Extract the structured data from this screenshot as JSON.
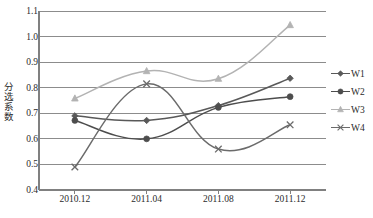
{
  "chart_data": {
    "type": "line",
    "title": "",
    "xlabel": "",
    "ylabel": "分选系数",
    "categories": [
      "2010.12",
      "2011.04",
      "2011.08",
      "2011.12"
    ],
    "ylim": [
      0.4,
      1.1
    ],
    "yticks": [
      "0.4",
      "0.5",
      "0.6",
      "0.7",
      "0.8",
      "0.9",
      "1.0",
      "1.1"
    ],
    "ytick_values": [
      0.4,
      0.5,
      0.6,
      0.7,
      0.8,
      0.9,
      1.0,
      1.1
    ],
    "grid": "horizontal",
    "legend_position": "right",
    "smoothing": "spline",
    "series": [
      {
        "name": "W1",
        "values": [
          0.69,
          0.672,
          0.73,
          0.837
        ],
        "color": "#595959",
        "marker": "diamond"
      },
      {
        "name": "W2",
        "values": [
          0.672,
          0.6,
          0.723,
          0.765
        ],
        "color": "#4d4d4d",
        "marker": "circle"
      },
      {
        "name": "W3",
        "values": [
          0.758,
          0.865,
          0.835,
          1.045
        ],
        "color": "#b3b3b3",
        "marker": "triangle"
      },
      {
        "name": "W4",
        "values": [
          0.49,
          0.815,
          0.56,
          0.655
        ],
        "color": "#6b6b6b",
        "marker": "cross"
      }
    ]
  },
  "axes": {
    "y_title": "分选系数",
    "frame_color": "#808080",
    "grid_color": "#8c8c8c"
  }
}
